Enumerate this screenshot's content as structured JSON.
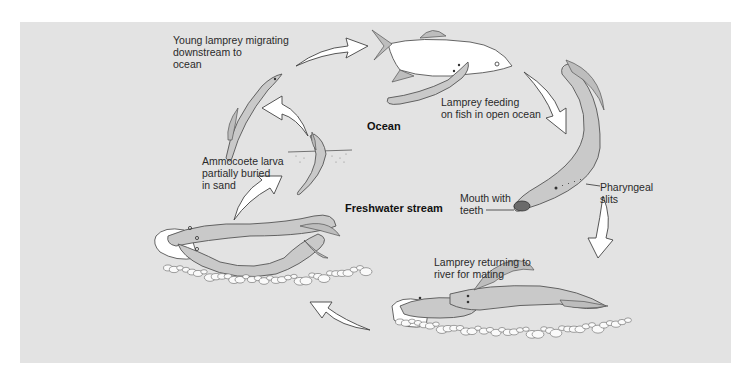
{
  "figure": {
    "background_color": "#e3e3e3",
    "zones": {
      "ocean": "Ocean",
      "freshwater": "Freshwater stream"
    },
    "stages": [
      {
        "id": "young-migrating",
        "label": "Young lamprey migrating\ndownstream to\nocean"
      },
      {
        "id": "feeding",
        "label": "Lamprey feeding\non fish in open ocean"
      },
      {
        "id": "returning",
        "label": "Lamprey returning to\nriver for mating"
      },
      {
        "id": "larva",
        "label": "Ammocoete larva\npartially buried\nin sand"
      }
    ],
    "annotations": {
      "mouth": "Mouth with\nteeth",
      "slits": "Pharyngeal\nslits"
    },
    "cycle_arrows": [
      {
        "from": "young-migrating",
        "to": "feeding"
      },
      {
        "from": "feeding",
        "to": "adult-closeup"
      },
      {
        "from": "adult-closeup",
        "to": "returning"
      },
      {
        "from": "returning",
        "to": "spawning"
      },
      {
        "from": "spawning",
        "to": "larva"
      },
      {
        "from": "larva",
        "to": "young-migrating"
      }
    ]
  }
}
